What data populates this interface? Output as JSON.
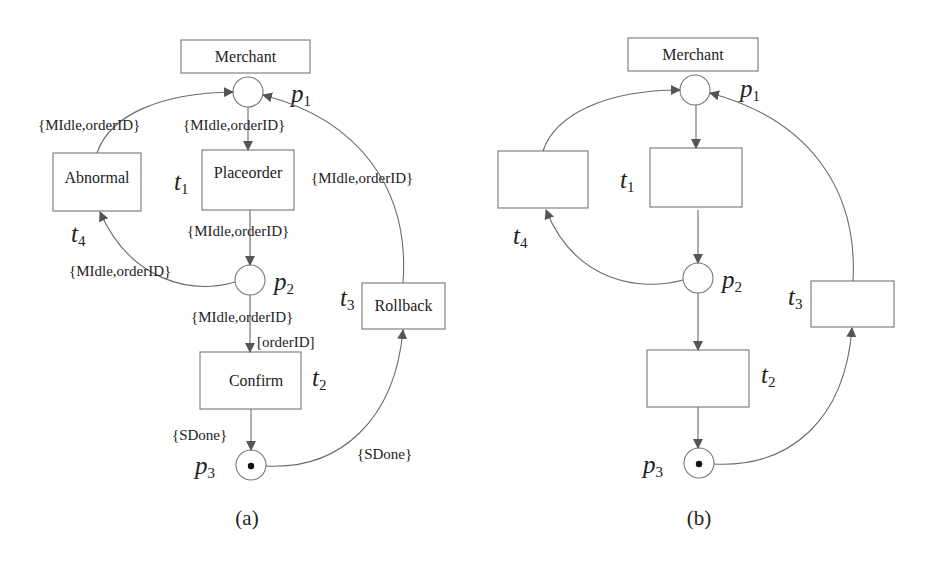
{
  "panels": [
    {
      "caption": "(a)",
      "header": "Merchant",
      "places": [
        {
          "id": "p",
          "sub": "1",
          "token": false
        },
        {
          "id": "p",
          "sub": "2",
          "token": false
        },
        {
          "id": "p",
          "sub": "3",
          "token": true
        }
      ],
      "transitions": [
        {
          "id": "t",
          "sub": "1",
          "label": "Placeorder"
        },
        {
          "id": "t",
          "sub": "2",
          "label": "Confirm"
        },
        {
          "id": "t",
          "sub": "3",
          "label": "Rollback"
        },
        {
          "id": "t",
          "sub": "4",
          "label": "Abnormal"
        }
      ],
      "arc_labels": {
        "t4_to_p1": "{MIdle,orderID}",
        "p1_to_t1": "{MIdle,orderID}",
        "t3_to_p1": "{MIdle,orderID}",
        "t1_to_p2": "{MIdle,orderID}",
        "p2_to_t4": "{MIdle,orderID}",
        "p2_to_t2": "{MIdle,orderID}",
        "t2_guard": "[orderID]",
        "t2_to_p3": "{SDone}",
        "p3_to_t3": "{SDone}"
      }
    },
    {
      "caption": "(b)",
      "header": "Merchant",
      "places": [
        {
          "id": "p",
          "sub": "1",
          "token": false
        },
        {
          "id": "p",
          "sub": "2",
          "token": false
        },
        {
          "id": "p",
          "sub": "3",
          "token": true
        }
      ],
      "transitions": [
        {
          "id": "t",
          "sub": "1",
          "label": ""
        },
        {
          "id": "t",
          "sub": "2",
          "label": ""
        },
        {
          "id": "t",
          "sub": "3",
          "label": ""
        },
        {
          "id": "t",
          "sub": "4",
          "label": ""
        }
      ]
    }
  ]
}
